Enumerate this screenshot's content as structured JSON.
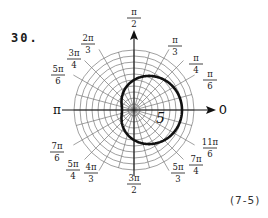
{
  "problem": {
    "number": "30."
  },
  "figure_ref": "(7-5)",
  "chart_data": {
    "type": "polar",
    "title": "",
    "equation_inferred": "r = 5 + 3 cos(θ)",
    "curve": {
      "kind": "limacon",
      "a": 5,
      "b": 3,
      "samples": [
        {
          "theta": "0",
          "r": 8
        },
        {
          "theta": "π/6",
          "r": 7.6
        },
        {
          "theta": "π/4",
          "r": 7.1
        },
        {
          "theta": "π/3",
          "r": 6.5
        },
        {
          "theta": "π/2",
          "r": 5
        },
        {
          "theta": "2π/3",
          "r": 3.5
        },
        {
          "theta": "3π/4",
          "r": 2.9
        },
        {
          "theta": "5π/6",
          "r": 2.4
        },
        {
          "theta": "π",
          "r": 2
        },
        {
          "theta": "7π/6",
          "r": 2.4
        },
        {
          "theta": "5π/4",
          "r": 2.9
        },
        {
          "theta": "4π/3",
          "r": 3.5
        },
        {
          "theta": "3π/2",
          "r": 5
        },
        {
          "theta": "5π/3",
          "r": 6.5
        },
        {
          "theta": "7π/4",
          "r": 7.1
        },
        {
          "theta": "11π/6",
          "r": 7.6
        }
      ]
    },
    "radial_rings": 10,
    "rlim": [
      0,
      10
    ],
    "radial_label": {
      "value": "5",
      "position_theta_deg": -20
    },
    "grid": true,
    "angle_labels": [
      {
        "num": "",
        "sym": "0",
        "den": "",
        "deg": 0
      },
      {
        "num": "π",
        "den": "6",
        "deg": 30
      },
      {
        "num": "π",
        "den": "4",
        "deg": 45
      },
      {
        "num": "π",
        "den": "3",
        "deg": 60
      },
      {
        "num": "π",
        "den": "2",
        "deg": 90
      },
      {
        "num": "2π",
        "den": "3",
        "deg": 120
      },
      {
        "num": "3π",
        "den": "4",
        "deg": 135
      },
      {
        "num": "5π",
        "den": "6",
        "deg": 150
      },
      {
        "num": "",
        "sym": "π",
        "den": "",
        "deg": 180
      },
      {
        "num": "7π",
        "den": "6",
        "deg": 210
      },
      {
        "num": "5π",
        "den": "4",
        "deg": 225
      },
      {
        "num": "4π",
        "den": "3",
        "deg": 240
      },
      {
        "num": "3π",
        "den": "2",
        "deg": 270
      },
      {
        "num": "5π",
        "den": "3",
        "deg": 300
      },
      {
        "num": "7π",
        "den": "4",
        "deg": 315
      },
      {
        "num": "11π",
        "den": "6",
        "deg": 330
      }
    ]
  }
}
